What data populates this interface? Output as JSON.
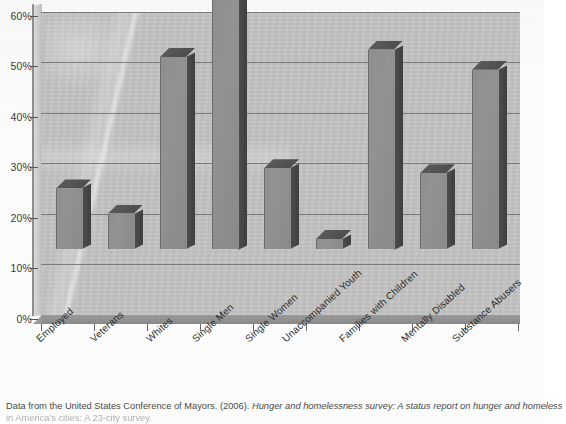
{
  "chart_data": {
    "type": "bar",
    "title": "",
    "xlabel": "",
    "ylabel": "",
    "ylim": [
      0,
      60
    ],
    "ytick_labels": [
      "0%",
      "10%",
      "20%",
      "30%",
      "40%",
      "50%",
      "60%"
    ],
    "ytick_values": [
      0,
      10,
      20,
      30,
      40,
      50,
      60
    ],
    "grid": true,
    "legend": "none",
    "style": "3d-column",
    "categories": [
      "Employed",
      "Veterans",
      "Whites",
      "Single Men",
      "Single Women",
      "Unaccompanied Youth",
      "Families with Children",
      "Mentally Disabled",
      "Substance Abusers"
    ],
    "values": [
      12,
      7,
      38,
      50,
      16,
      2,
      39.5,
      15,
      35.5
    ],
    "value_unit": "%"
  },
  "caption": {
    "line1_prefix": "Data from the United States Conference of Mayors. (2006). ",
    "line1_italic": "Hunger and homelessness survey: A status report on hunger and homeless",
    "line2": "in America's cities: A 23-city survey."
  },
  "colors": {
    "plot_background": "#c2c2c2",
    "bar_front": "#909090",
    "bar_side": "#474747",
    "gridline": "#6e6e6e",
    "axis": "#4a4a4a",
    "text": "#2f2f2f",
    "page_background": "#fefefe"
  }
}
